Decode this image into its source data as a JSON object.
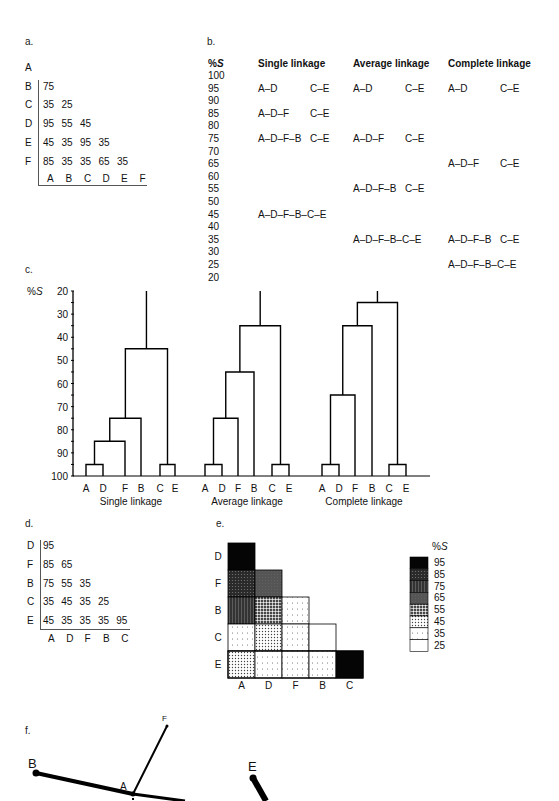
{
  "panels": {
    "a": {
      "label": "a.",
      "title": "",
      "row_labels": [
        "A",
        "B",
        "C",
        "D",
        "E",
        "F"
      ],
      "col_labels": [
        "A",
        "B",
        "C",
        "D",
        "E",
        "F"
      ],
      "rows": [
        [],
        [
          "75"
        ],
        [
          "35",
          "25"
        ],
        [
          "95",
          "55",
          "45"
        ],
        [
          "45",
          "35",
          "95",
          "35"
        ],
        [
          "85",
          "35",
          "35",
          "65",
          "35"
        ]
      ]
    },
    "b": {
      "label": "b.",
      "scale_header": "%S",
      "columns": [
        "Single linkage",
        "Average linkage",
        "Complete linkage"
      ],
      "scale": [
        "100",
        "95",
        "90",
        "85",
        "80",
        "75",
        "70",
        "65",
        "60",
        "55",
        "50",
        "45",
        "40",
        "35",
        "30",
        "25",
        "20"
      ],
      "single": {
        "95": [
          "A–D",
          "C–E"
        ],
        "85": [
          "A–D–F",
          "C–E"
        ],
        "75": [
          "A–D–F–B",
          "C–E"
        ],
        "45": [
          "A–D–F–B–C–E",
          ""
        ]
      },
      "average": {
        "95": [
          "A–D",
          "C–E"
        ],
        "75": [
          "A–D–F",
          "C–E"
        ],
        "55": [
          "A–D–F–B",
          "C–E"
        ],
        "35": [
          "A–D–F–B–C–E",
          ""
        ]
      },
      "complete": {
        "95": [
          "A–D",
          "C–E"
        ],
        "65": [
          "A–D–F",
          "C–E"
        ],
        "35": [
          "A–D–F–B",
          "C–E"
        ],
        "25": [
          "A–D–F–B–C–E",
          ""
        ]
      }
    },
    "c": {
      "label": "c.",
      "axis_label": "%S",
      "ticks": [
        "20",
        "30",
        "40",
        "50",
        "60",
        "70",
        "80",
        "90",
        "100"
      ],
      "leaf_order": [
        "A",
        "D",
        "F",
        "B",
        "C",
        "E"
      ],
      "dendrograms": [
        {
          "title": "Single linkage",
          "merges": {
            "AD": 95,
            "ADF": 85,
            "ADFB": 75,
            "CE": 95,
            "ALL": 45
          }
        },
        {
          "title": "Average linkage",
          "merges": {
            "AD": 95,
            "ADF": 75,
            "ADFB": 55,
            "CE": 95,
            "ALL": 35
          }
        },
        {
          "title": "Complete linkage",
          "merges": {
            "AD": 95,
            "ADF": 65,
            "ADFB": 35,
            "CE": 95,
            "ALL": 25
          }
        }
      ]
    },
    "d": {
      "label": "d.",
      "row_labels": [
        "D",
        "F",
        "B",
        "C",
        "E"
      ],
      "col_labels": [
        "A",
        "D",
        "F",
        "B",
        "C"
      ],
      "rows": [
        [
          "95"
        ],
        [
          "85",
          "65"
        ],
        [
          "75",
          "55",
          "35"
        ],
        [
          "35",
          "45",
          "35",
          "25"
        ],
        [
          "45",
          "35",
          "35",
          "35",
          "95"
        ]
      ]
    },
    "e": {
      "label": "e.",
      "row_labels": [
        "D",
        "F",
        "B",
        "C",
        "E"
      ],
      "col_labels": [
        "A",
        "D",
        "F",
        "B",
        "C"
      ],
      "legend_title": "%S",
      "legend": [
        "95",
        "85",
        "75",
        "65",
        "55",
        "45",
        "35",
        "25"
      ],
      "values": [
        [
          95
        ],
        [
          85,
          65
        ],
        [
          75,
          55,
          35
        ],
        [
          35,
          45,
          35,
          25
        ],
        [
          45,
          35,
          35,
          35,
          95
        ]
      ]
    },
    "f": {
      "label": "f.",
      "nodes": [
        "A",
        "B",
        "E",
        "F"
      ]
    }
  },
  "chart_data": {
    "type": "dendrogram",
    "similarity_matrix": {
      "labels": [
        "A",
        "B",
        "C",
        "D",
        "E",
        "F"
      ],
      "lower_triangle": [
        [],
        [
          75
        ],
        [
          35,
          25
        ],
        [
          95,
          55,
          45
        ],
        [
          45,
          35,
          95,
          35
        ],
        [
          85,
          35,
          35,
          65,
          35
        ]
      ]
    },
    "ylabel": "%S",
    "ylim": [
      20,
      100
    ],
    "series": [
      {
        "name": "Single linkage",
        "merges": [
          [
            "A–D",
            95
          ],
          [
            "C–E",
            95
          ],
          [
            "A–D–F",
            85
          ],
          [
            "A–D–F–B",
            75
          ],
          [
            "A–D–F–B–C–E",
            45
          ]
        ]
      },
      {
        "name": "Average linkage",
        "merges": [
          [
            "A–D",
            95
          ],
          [
            "C–E",
            95
          ],
          [
            "A–D–F",
            75
          ],
          [
            "A–D–F–B",
            55
          ],
          [
            "A–D–F–B–C–E",
            35
          ]
        ]
      },
      {
        "name": "Complete linkage",
        "merges": [
          [
            "A–D",
            95
          ],
          [
            "C–E",
            95
          ],
          [
            "A–D–F",
            65
          ],
          [
            "A–D–F–B",
            35
          ],
          [
            "A–D–F–B–C–E",
            25
          ]
        ]
      }
    ]
  }
}
